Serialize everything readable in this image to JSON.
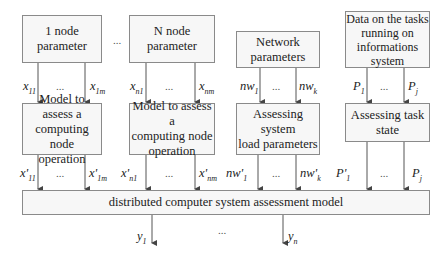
{
  "diagram": {
    "top_boxes": [
      {
        "id": "node1",
        "lines": [
          "1 node",
          "parameter"
        ]
      },
      {
        "id": "nodeN",
        "lines": [
          "N node",
          "parameter"
        ]
      },
      {
        "id": "network",
        "lines": [
          "Network",
          "parameters"
        ]
      },
      {
        "id": "tasks",
        "lines": [
          "Data on the tasks",
          "running on",
          "informations",
          "system"
        ]
      }
    ],
    "between_dots": "...",
    "mid_boxes": [
      {
        "id": "model1",
        "lines": [
          "Model to assess a",
          "computing node",
          "operation"
        ]
      },
      {
        "id": "modelN",
        "lines": [
          "Model to assess a",
          "computing node",
          "operation"
        ]
      },
      {
        "id": "load",
        "lines": [
          "Assessing system",
          "load parameters"
        ]
      },
      {
        "id": "taskstate",
        "lines": [
          "Assessing task",
          "state"
        ]
      }
    ],
    "input_labels": {
      "x11": "x11",
      "x1m": "x1m",
      "xn1": "xn1",
      "xnm": "xnm",
      "nw1": "nw1",
      "nwk": "nwk",
      "P1": "P1",
      "Pj": "Pj"
    },
    "output_labels": {
      "x11p": "x'11",
      "x1mp": "x'1m",
      "xn1p": "x'n1",
      "xnmp": "x'nm",
      "nw1p": "nw'1",
      "nwkp": "nw'k",
      "P1p": "P'1",
      "Pjp": "Pj"
    },
    "main_box": "distributed computer system assessment model",
    "results": {
      "y1": "y1",
      "yn": "yn"
    },
    "ellipsis": "..."
  }
}
